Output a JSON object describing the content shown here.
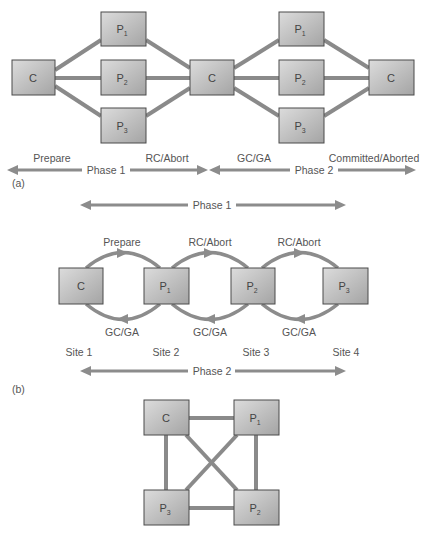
{
  "colors": {
    "edge": "#8a8a8a",
    "box_fill_light": "#d8d8d8",
    "box_fill_dark": "#a6a6a6",
    "box_border": "#4a4a4a",
    "text": "#555555"
  },
  "part_a": {
    "caption": "(a)",
    "nodes": [
      {
        "id": "c1",
        "label": "C",
        "sub": ""
      },
      {
        "id": "p1a",
        "label": "P",
        "sub": "1"
      },
      {
        "id": "p2a",
        "label": "P",
        "sub": "2"
      },
      {
        "id": "p3a",
        "label": "P",
        "sub": "3"
      },
      {
        "id": "c2",
        "label": "C",
        "sub": ""
      },
      {
        "id": "p1b",
        "label": "P",
        "sub": "1"
      },
      {
        "id": "p2b",
        "label": "P",
        "sub": "2"
      },
      {
        "id": "p3b",
        "label": "P",
        "sub": "3"
      },
      {
        "id": "c3",
        "label": "C",
        "sub": ""
      }
    ],
    "message_labels": [
      "Prepare",
      "RC/Abort",
      "GC/GA",
      "Committed/Aborted"
    ],
    "phase_labels": [
      "Phase 1",
      "Phase 2"
    ]
  },
  "part_b": {
    "caption": "(b)",
    "phase1_label": "Phase 1",
    "phase2_label": "Phase 2",
    "top_messages": [
      "Prepare",
      "RC/Abort",
      "RC/Abort"
    ],
    "bottom_messages": [
      "GC/GA",
      "GC/GA",
      "GC/GA"
    ],
    "nodes": [
      {
        "label": "C",
        "sub": ""
      },
      {
        "label": "P",
        "sub": "1"
      },
      {
        "label": "P",
        "sub": "2"
      },
      {
        "label": "P",
        "sub": "3"
      }
    ],
    "sites": [
      "Site 1",
      "Site 2",
      "Site 3",
      "Site 4"
    ]
  },
  "part_c": {
    "nodes": [
      {
        "label": "C",
        "sub": ""
      },
      {
        "label": "P",
        "sub": "1"
      },
      {
        "label": "P",
        "sub": "3"
      },
      {
        "label": "P",
        "sub": "2"
      }
    ]
  }
}
